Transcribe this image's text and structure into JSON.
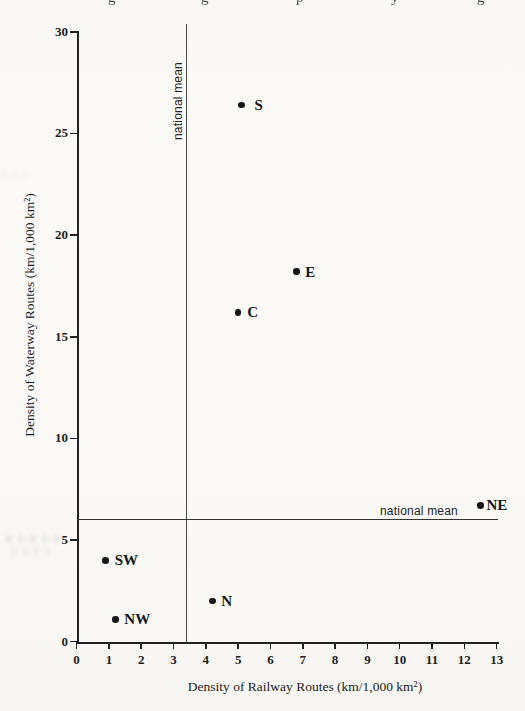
{
  "figure": {
    "cropped_header_fragments": [
      {
        "char": "g",
        "x": 108
      },
      {
        "char": "g",
        "x": 201
      },
      {
        "char": "p",
        "x": 296
      },
      {
        "char": "y",
        "x": 391
      },
      {
        "char": "g",
        "x": 477
      }
    ]
  },
  "chart_data": {
    "type": "scatter",
    "title": "",
    "xlabel": "Density of Railway Routes (km/1,000 km²)",
    "ylabel": "Density of Waterway Routes (km/1,000 km²)",
    "xlim": [
      0,
      13
    ],
    "ylim": [
      0,
      30
    ],
    "x_ticks": [
      0,
      1,
      2,
      3,
      4,
      5,
      6,
      7,
      8,
      9,
      10,
      11,
      12,
      13
    ],
    "y_ticks": [
      0,
      5,
      10,
      15,
      20,
      25,
      30
    ],
    "grid": false,
    "legend": "none",
    "marker": {
      "shape": "filled-circle",
      "color": "#161616"
    },
    "points": [
      {
        "label": "S",
        "x": 5.1,
        "y": 26.4
      },
      {
        "label": "E",
        "x": 6.8,
        "y": 18.2
      },
      {
        "label": "C",
        "x": 5.0,
        "y": 16.2
      },
      {
        "label": "NE",
        "x": 12.5,
        "y": 6.7
      },
      {
        "label": "SW",
        "x": 0.9,
        "y": 4.0
      },
      {
        "label": "N",
        "x": 4.2,
        "y": 2.0
      },
      {
        "label": "NW",
        "x": 1.2,
        "y": 1.1
      }
    ],
    "mean_lines": {
      "vertical": {
        "value": 3.4,
        "label": "national mean"
      },
      "horizontal": {
        "value": 6.0,
        "label": "national mean"
      }
    },
    "colors": {
      "ink": "#1b1b1b",
      "axis": "#222222",
      "mean_line": "#4a4a4a",
      "background": "#faf9f6"
    }
  }
}
